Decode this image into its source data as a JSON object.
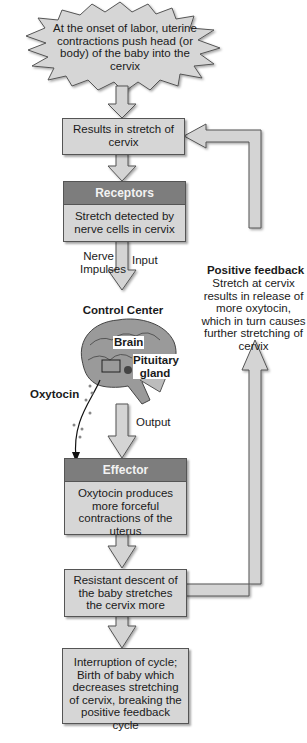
{
  "diagram": {
    "start_event": "At the onset of labor, uterine contractions push head (or body) of the baby into the cervix",
    "steps": [
      {
        "id": "stimulus",
        "text": "Results in stretch of cervix"
      },
      {
        "id": "receptors",
        "header": "Receptors",
        "text": "Stretch detected by nerve cells in cervix"
      },
      {
        "id": "control_center",
        "header": "Control Center",
        "brain_label": "Brain",
        "gland_label": "Pituitary gland"
      },
      {
        "id": "effector",
        "header": "Effector",
        "text": "Oxytocin produces more forceful contractions of the uterus"
      },
      {
        "id": "response",
        "text": "Resistant descent of the baby stretches the cervix more"
      },
      {
        "id": "end",
        "text": "Interruption of cycle; Birth of baby which decreases stretching of cervix, breaking the positive feedback cycle"
      }
    ],
    "labels": {
      "nerve_impulses": "Nerve Impulses",
      "input": "Input",
      "output": "Output",
      "oxytocin": "Oxytocin",
      "feedback_title": "Positive feedback",
      "feedback_text": "Stretch at cervix results in release of more oxytocin, which in turn causes further stretching of cervix"
    },
    "colors": {
      "box_fill": "#d6d6d6",
      "header_fill": "#7d7d7d",
      "arrow_fill": "#d4d4d4",
      "outline": "#555555"
    }
  }
}
